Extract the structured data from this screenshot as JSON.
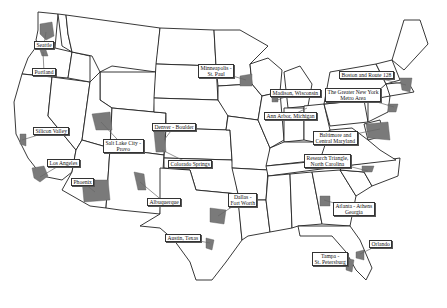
{
  "map": {
    "title": "",
    "background": "#ffffff",
    "region_color": "#7a7a7a",
    "regions": [
      {
        "id": "seattle",
        "label": "Seattle",
        "lx": 34,
        "ly": 41,
        "rx": 46,
        "ry": 32
      },
      {
        "id": "portland",
        "label": "Portland",
        "lx": 32,
        "ly": 68,
        "rx": 43,
        "ry": 52
      },
      {
        "id": "silicon-valley",
        "label": "Silicon Valley",
        "lx": 33,
        "ly": 127,
        "rx": 22,
        "ry": 140
      },
      {
        "id": "los-angeles",
        "label": "Los Angeles",
        "lx": 47,
        "ly": 159,
        "rx": 40,
        "ry": 177
      },
      {
        "id": "phoenix",
        "label": "Phoenix",
        "lx": 71,
        "ly": 178,
        "rx": 95,
        "ry": 192
      },
      {
        "id": "salt-lake-city",
        "label": "Salt Lake City -\nProvo",
        "lx": 103,
        "ly": 139,
        "rx": 101,
        "ry": 122
      },
      {
        "id": "denver-boulder",
        "label": "Denver - Boulder",
        "lx": 152,
        "ly": 123,
        "rx": 164,
        "ry": 140
      },
      {
        "id": "colorado-springs",
        "label": "Colorado Springs",
        "lx": 168,
        "ly": 160,
        "rx": 162,
        "ry": 150
      },
      {
        "id": "albuquerque",
        "label": "Albuquerque",
        "lx": 147,
        "ly": 198,
        "rx": 140,
        "ry": 182
      },
      {
        "id": "dallas-fort-worth",
        "label": "Dallas -\nFort Worth",
        "lx": 228,
        "ly": 193,
        "rx": 218,
        "ry": 216
      },
      {
        "id": "austin",
        "label": "Austin, Texas",
        "lx": 165,
        "ly": 234,
        "rx": 210,
        "ry": 243
      },
      {
        "id": "minneapolis",
        "label": "Minneapolis -\nSt. Paul",
        "lx": 198,
        "ly": 64,
        "rx": 246,
        "ry": 80
      },
      {
        "id": "madison",
        "label": "Madison, Wisconsin",
        "lx": 270,
        "ly": 89,
        "rx": 275,
        "ry": 101
      },
      {
        "id": "ann-arbor",
        "label": "Ann Arbor, Michigan",
        "lx": 264,
        "ly": 112,
        "rx": 307,
        "ry": 108
      },
      {
        "id": "boston",
        "label": "Boston and Route 128",
        "lx": 339,
        "ly": 71,
        "rx": 406,
        "ry": 85
      },
      {
        "id": "new-york",
        "label": "The Greater New York\nMetro Area",
        "lx": 325,
        "ly": 88,
        "rx": 394,
        "ry": 107
      },
      {
        "id": "baltimore",
        "label": "Baltimore and\nCentral Maryland",
        "lx": 313,
        "ly": 131,
        "rx": 380,
        "ry": 129
      },
      {
        "id": "research-triangle",
        "label": "Research Triangle,\nNorth Carolina",
        "lx": 304,
        "ly": 154,
        "rx": 368,
        "ry": 171
      },
      {
        "id": "atlanta",
        "label": "Atlanta - Athens\nGeorgia",
        "lx": 333,
        "ly": 202,
        "rx": 324,
        "ry": 200
      },
      {
        "id": "orlando",
        "label": "Orlando",
        "lx": 369,
        "ly": 240,
        "rx": 360,
        "ry": 254
      },
      {
        "id": "tampa",
        "label": "Tampa -\nSt. Petersburg",
        "lx": 312,
        "ly": 252,
        "rx": 350,
        "ry": 262
      }
    ]
  }
}
